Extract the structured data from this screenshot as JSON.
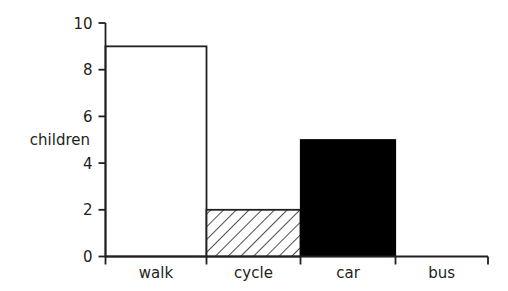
{
  "chart_data": {
    "type": "bar",
    "title": "",
    "subtitle": "",
    "xlabel": "",
    "ylabel": "children",
    "categories": [
      "walk",
      "cycle",
      "car",
      "bus"
    ],
    "values": [
      9,
      2,
      5,
      0
    ],
    "series": [
      {
        "name": "children",
        "values": [
          9,
          2,
          5,
          0
        ]
      }
    ],
    "bar_styles": [
      "white-outline",
      "diagonal-hatch",
      "solid-black",
      "none"
    ],
    "ylim": [
      0,
      10
    ],
    "ytick_labels": [
      "0",
      "2",
      "4",
      "6",
      "8",
      "10"
    ],
    "ytick_values": [
      0,
      2,
      4,
      6,
      8,
      10
    ],
    "grid": false,
    "legend": "none",
    "annotations": []
  },
  "colors": {
    "axis": "#231f20",
    "text": "#231f20",
    "bar_outline": "#231f20",
    "bar_fill_black": "#000000",
    "bar_fill_white": "#ffffff",
    "hatch_line": "#231f20",
    "background": "#ffffff"
  }
}
